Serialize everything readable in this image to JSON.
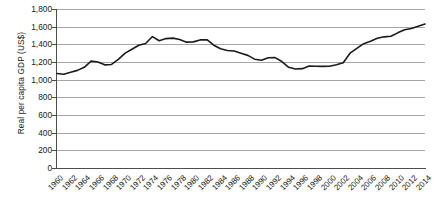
{
  "chart_data": {
    "type": "line",
    "title": "",
    "xlabel": "",
    "ylabel": "Real per capita GDP (US$)",
    "ylim": [
      0,
      1800
    ],
    "ytick_step": 200,
    "ytick_labels": [
      "1,800",
      "1,600",
      "1,400",
      "1,200",
      "1,000",
      "800",
      "600",
      "400",
      "200",
      "0"
    ],
    "ytick_values": [
      1800,
      1600,
      1400,
      1200,
      1000,
      800,
      600,
      400,
      200,
      0
    ],
    "xlim": [
      1960,
      2014
    ],
    "xtick_labels": [
      "1960",
      "1962",
      "1964",
      "1966",
      "1968",
      "1970",
      "1972",
      "1974",
      "1976",
      "1978",
      "1980",
      "1982",
      "1984",
      "1986",
      "1988",
      "1990",
      "1992",
      "1994",
      "1996",
      "1998",
      "2000",
      "2002",
      "2004",
      "2006",
      "2008",
      "2010",
      "2012",
      "2014"
    ],
    "xtick_values": [
      1960,
      1962,
      1964,
      1966,
      1968,
      1970,
      1972,
      1974,
      1976,
      1978,
      1980,
      1982,
      1984,
      1986,
      1988,
      1990,
      1992,
      1994,
      1996,
      1998,
      2000,
      2002,
      2004,
      2006,
      2008,
      2010,
      2012,
      2014
    ],
    "grid": "horizontal",
    "legend": "none",
    "line_color": "#1a1a1a",
    "grid_color": "#a6a6a6",
    "x": [
      1960,
      1961,
      1962,
      1963,
      1964,
      1965,
      1966,
      1967,
      1968,
      1969,
      1970,
      1971,
      1972,
      1973,
      1974,
      1975,
      1976,
      1977,
      1978,
      1979,
      1980,
      1981,
      1982,
      1983,
      1984,
      1985,
      1986,
      1987,
      1988,
      1989,
      1990,
      1991,
      1992,
      1993,
      1994,
      1995,
      1996,
      1997,
      1998,
      1999,
      2000,
      2001,
      2002,
      2003,
      2004,
      2005,
      2006,
      2007,
      2008,
      2009,
      2010,
      2011,
      2012,
      2013,
      2014
    ],
    "values": [
      1070,
      1062,
      1085,
      1105,
      1140,
      1210,
      1200,
      1168,
      1172,
      1230,
      1300,
      1345,
      1390,
      1410,
      1488,
      1440,
      1465,
      1470,
      1455,
      1425,
      1428,
      1450,
      1452,
      1390,
      1350,
      1330,
      1325,
      1300,
      1275,
      1232,
      1220,
      1248,
      1250,
      1205,
      1140,
      1120,
      1125,
      1155,
      1152,
      1150,
      1152,
      1168,
      1192,
      1300,
      1355,
      1408,
      1435,
      1468,
      1485,
      1492,
      1530,
      1565,
      1580,
      1605,
      1630
    ],
    "series_name": "Real per capita GDP"
  }
}
